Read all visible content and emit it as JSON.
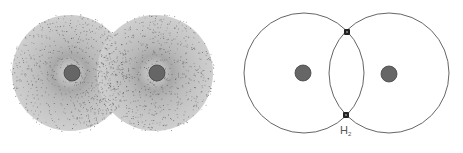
{
  "diagrams": [
    {
      "name": "electron-cloud-model",
      "style": "stippled",
      "atoms": [
        {
          "cx": 70,
          "cy": 73,
          "r": 58,
          "nucleus": {
            "cx": 72,
            "cy": 73,
            "r": 8
          }
        },
        {
          "cx": 155,
          "cy": 73,
          "r": 58,
          "nucleus": {
            "cx": 157,
            "cy": 73,
            "r": 8
          }
        }
      ]
    },
    {
      "name": "orbit-model",
      "style": "outline",
      "atoms": [
        {
          "cx": 304,
          "cy": 73,
          "r": 60,
          "nucleus": {
            "cx": 303,
            "cy": 73,
            "r": 8
          }
        },
        {
          "cx": 389,
          "cy": 73,
          "r": 60,
          "nucleus": {
            "cx": 389,
            "cy": 74,
            "r": 8
          }
        }
      ],
      "shared_electrons": [
        {
          "cx": 347,
          "cy": 32,
          "r": 3
        },
        {
          "cx": 346,
          "cy": 115,
          "r": 3
        }
      ],
      "label": {
        "base": "H",
        "subscript": "2",
        "x": 340,
        "y": 124
      }
    }
  ],
  "colors": {
    "nucleus": "#666666",
    "nucleus_stroke": "#444444",
    "cloud_fill": "#c8c8c8",
    "cloud_dots": "#555555",
    "orbit_line": "#666666",
    "electron": "#222222",
    "label": "#555555"
  }
}
